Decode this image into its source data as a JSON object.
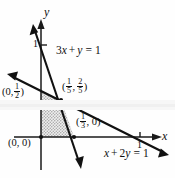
{
  "figure": {
    "type": "math-graph",
    "title": "",
    "axes": {
      "x_label": "x",
      "y_label": "y",
      "x_tick_label": "1",
      "y_tick_label": "1"
    },
    "lines": [
      {
        "id": "line1",
        "label_plain": "3x + y = 1",
        "coef_x": 3,
        "coef_y": 1,
        "rhs": 1,
        "label_parts": {
          "a": "3",
          "x": "x",
          "plus": "+",
          "y": "y",
          "eq": "=",
          "rhs": "1"
        }
      },
      {
        "id": "line2",
        "label_plain": "x + 2y = 1",
        "coef_x": 1,
        "coef_y": 2,
        "rhs": 1,
        "label_parts": {
          "x": "x",
          "plus": "+",
          "b": "2",
          "y": "y",
          "eq": "=",
          "rhs": "1"
        }
      }
    ],
    "points": [
      {
        "id": "origin",
        "label_plain": "(0, 0)",
        "x": 0,
        "y": 0
      },
      {
        "id": "y-intercept",
        "label_plain": "(0, 1/2)",
        "x": 0,
        "y": 0.5,
        "parts": {
          "open": "(0,",
          "num": "1",
          "den": "2",
          "close": ")"
        }
      },
      {
        "id": "x-intercept",
        "label_plain": "(1/3, 0)",
        "x": 0.3333,
        "y": 0,
        "parts": {
          "open": "(",
          "num": "1",
          "den": "3",
          "mid": ", 0",
          "close": ")"
        }
      },
      {
        "id": "intersection",
        "label_plain": "(1/5, 2/5)",
        "x": 0.2,
        "y": 0.4,
        "parts": {
          "open": "(",
          "num1": "1",
          "den1": "5",
          "comma": ",",
          "num2": "2",
          "den2": "5",
          "close": ")"
        }
      }
    ],
    "region": {
      "name": "feasible-region",
      "shading": "stipple-gray",
      "vertices_plain": [
        "(0, 0)",
        "(1/3, 0)",
        "(1/5, 2/5)",
        "(0, 1/2)"
      ]
    },
    "colors": {
      "ink": "#101010",
      "axis": "#1a1a1a",
      "shade_fill": "#c9c9c9",
      "background": "#fefefe",
      "scan_band": "#f0f0f0"
    }
  }
}
